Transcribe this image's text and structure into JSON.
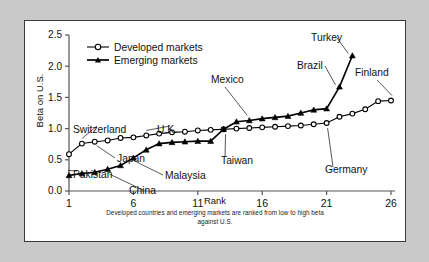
{
  "figure": {
    "background_color": "#c9c9c9",
    "panel_color": "#ffffff",
    "border_color": "#3a3a3a"
  },
  "chart_data": {
    "type": "line",
    "title": "",
    "xlabel": "Rank",
    "ylabel": "Beta on U.S.",
    "xlim": [
      1,
      26
    ],
    "ylim": [
      0.0,
      2.5
    ],
    "xticks": [
      "1",
      "6",
      "11",
      "16",
      "21",
      "26"
    ],
    "xtick_values": [
      1,
      6,
      11,
      16,
      21,
      26
    ],
    "yticks": [
      "0.0",
      "0.5",
      "1.0",
      "1.5",
      "2.0",
      "2.5"
    ],
    "ytick_values": [
      0.0,
      0.5,
      1.0,
      1.5,
      2.0,
      2.5
    ],
    "grid": false,
    "legend_position": "top-left",
    "caption_line_1": "Developed countries and emerging markets are ranked from low to high beta",
    "caption_line_2": "against U.S.",
    "series": [
      {
        "name": "Developed markets",
        "marker": "open-circle",
        "color": "#000000",
        "x": [
          1,
          2,
          3,
          4,
          5,
          6,
          7,
          8,
          9,
          10,
          11,
          12,
          13,
          14,
          15,
          16,
          17,
          18,
          19,
          20,
          21,
          22,
          23,
          24,
          25,
          26
        ],
        "values": [
          0.59,
          0.76,
          0.79,
          0.81,
          0.85,
          0.86,
          0.89,
          0.92,
          0.94,
          0.95,
          0.97,
          0.98,
          0.99,
          1.0,
          1.01,
          1.02,
          1.03,
          1.04,
          1.05,
          1.07,
          1.09,
          1.19,
          1.24,
          1.31,
          1.44,
          1.45
        ]
      },
      {
        "name": "Emerging markets",
        "marker": "filled-triangle",
        "color": "#000000",
        "x": [
          1,
          2,
          3,
          4,
          5,
          6,
          7,
          8,
          9,
          10,
          11,
          12,
          13,
          14,
          15,
          16,
          17,
          18,
          19,
          20,
          21,
          22,
          23
        ],
        "values": [
          0.25,
          0.28,
          0.3,
          0.35,
          0.41,
          0.53,
          0.66,
          0.76,
          0.78,
          0.79,
          0.8,
          0.8,
          0.99,
          1.11,
          1.13,
          1.16,
          1.18,
          1.2,
          1.25,
          1.3,
          1.32,
          1.67,
          2.17
        ]
      }
    ],
    "annotations": [
      {
        "label": "Switzerland",
        "series": "Developed markets",
        "rank": 2,
        "beta": 0.76
      },
      {
        "label": "U.K.",
        "series": "Developed markets",
        "rank": 7,
        "beta": 0.89
      },
      {
        "label": "Japan",
        "series": "Developed markets",
        "rank": 3,
        "beta": 0.79
      },
      {
        "label": "Germany",
        "series": "Developed markets",
        "rank": 21,
        "beta": 1.09
      },
      {
        "label": "Finland",
        "series": "Developed markets",
        "rank": 26,
        "beta": 1.45
      },
      {
        "label": "Pakistan",
        "series": "Emerging markets",
        "rank": 1,
        "beta": 0.25
      },
      {
        "label": "China",
        "series": "Emerging markets",
        "rank": 4,
        "beta": 0.35
      },
      {
        "label": "Malaysia",
        "series": "Emerging markets",
        "rank": 6,
        "beta": 0.53
      },
      {
        "label": "Taiwan",
        "series": "Emerging markets",
        "rank": 13,
        "beta": 0.99
      },
      {
        "label": "Mexico",
        "series": "Emerging markets",
        "rank": 15,
        "beta": 1.13
      },
      {
        "label": "Brazil",
        "series": "Emerging markets",
        "rank": 22,
        "beta": 1.67
      },
      {
        "label": "Turkey",
        "series": "Emerging markets",
        "rank": 23,
        "beta": 2.17
      }
    ]
  }
}
